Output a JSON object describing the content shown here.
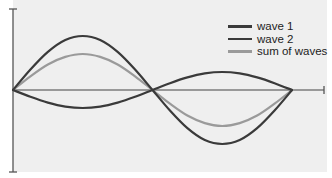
{
  "chart_data": {
    "type": "line",
    "title": "",
    "xlabel": "",
    "ylabel": "",
    "grid": false,
    "legend_position": "upper right",
    "x_range": [
      0,
      6.2832
    ],
    "ylim": [
      -2.45,
      2.45
    ],
    "x": [
      0,
      0.3927,
      0.7854,
      1.1781,
      1.5708,
      1.9635,
      2.3562,
      2.7489,
      3.1416,
      3.5343,
      3.927,
      4.3197,
      4.7124,
      5.1051,
      5.4978,
      5.8905,
      6.2832
    ],
    "series": [
      {
        "name": "wave 1",
        "color": "#3a3a3a",
        "values": [
          0,
          0.57,
          1.06,
          1.39,
          1.5,
          1.39,
          1.06,
          0.57,
          0,
          -0.57,
          -1.06,
          -1.39,
          -1.5,
          -1.39,
          -1.06,
          -0.57,
          0
        ]
      },
      {
        "name": "wave 2",
        "color": "#3a3a3a",
        "values": [
          0,
          -0.19,
          -0.35,
          -0.46,
          -0.5,
          -0.46,
          -0.35,
          -0.19,
          0,
          0.19,
          0.35,
          0.46,
          0.5,
          0.46,
          0.35,
          0.19,
          0
        ]
      },
      {
        "name": "sum of waves",
        "color": "#9a9a9a",
        "values": [
          0,
          0.38,
          0.71,
          0.92,
          1.0,
          0.92,
          0.71,
          0.38,
          0,
          -0.38,
          -0.71,
          -0.92,
          -1.0,
          -0.92,
          -0.71,
          -0.38,
          0
        ]
      }
    ]
  },
  "style": {
    "plot_background": "#efefef",
    "axis_color": "#555555"
  },
  "legend": {
    "items": [
      {
        "label": "wave 1",
        "color": "#3a3a3a"
      },
      {
        "label": "wave 2",
        "color": "#3a3a3a"
      },
      {
        "label": "sum of waves",
        "color": "#9a9a9a"
      }
    ]
  }
}
